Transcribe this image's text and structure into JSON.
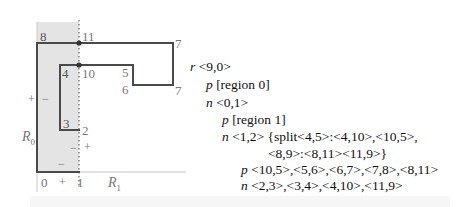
{
  "figure": {
    "region_labels": {
      "r0": "R",
      "r0_sub": "0",
      "r1": "R",
      "r1_sub": "1"
    },
    "vertex_labels": [
      {
        "id": "0",
        "text": "0"
      },
      {
        "id": "1",
        "text": "1"
      },
      {
        "id": "2",
        "text": "2"
      },
      {
        "id": "3",
        "text": "3"
      },
      {
        "id": "4",
        "text": "4"
      },
      {
        "id": "5",
        "text": "5"
      },
      {
        "id": "6",
        "text": "6"
      },
      {
        "id": "7",
        "text": "7"
      },
      {
        "id": "8",
        "text": "8"
      },
      {
        "id": "9",
        "text": "9"
      },
      {
        "id": "10",
        "text": "10"
      },
      {
        "id": "11",
        "text": "11"
      }
    ],
    "sign_labels": {
      "left_plus": "+",
      "left_minus": "−",
      "mid_minus": "−",
      "mid_plus": "+",
      "bottom_minus": "−",
      "axis_plus": "+"
    },
    "colors": {
      "region0_fill": "#e3e3e3",
      "polygon_stroke": "#4a4a4a",
      "axis_stroke": "#bbbbbb",
      "dot": "#333333"
    }
  },
  "tree": {
    "lines": [
      {
        "kw": "r",
        "rest": " <9,0>"
      },
      {
        "kw": "p",
        "rest": " [region 0]"
      },
      {
        "kw": "n",
        "rest": " <0,1>"
      },
      {
        "kw": "p",
        "rest": " [region 1]"
      },
      {
        "kw": "n",
        "rest": " <1,2> {split<4,5>:<4,10>,<10,5>,"
      },
      {
        "kw": "",
        "rest": "<8,9>:<8,11><11,9>}"
      },
      {
        "kw": "p",
        "rest": " <10,5>,<5,6>,<6,7>,<7,8>,<8,11>"
      },
      {
        "kw": "n",
        "rest": " <2,3>,<3,4>,<4,10>,<11,9>"
      }
    ]
  }
}
